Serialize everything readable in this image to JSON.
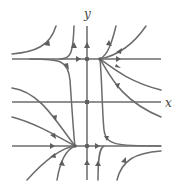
{
  "figure": {
    "type": "phase-portrait",
    "axes": {
      "x_label": "x",
      "y_label": "y"
    },
    "colors": {
      "curve": "#6b6b6b",
      "arrow": "#5e5e5e",
      "background": "#ffffff"
    },
    "equilibria": [
      {
        "position": "upper-left-on-y-axis",
        "px": [
          87,
          59
        ]
      },
      {
        "position": "upper-right",
        "px": [
          100,
          59
        ]
      },
      {
        "position": "lower-on-y-axis",
        "px": [
          87,
          146
        ]
      },
      {
        "position": "lower-left",
        "px": [
          75,
          146
        ]
      }
    ],
    "invariant_lines": [
      {
        "name": "upper-horizontal",
        "y_px": 59
      },
      {
        "name": "x-axis",
        "y_px": 102
      },
      {
        "name": "lower-horizontal",
        "y_px": 146
      },
      {
        "name": "y-axis",
        "x_px": 87
      }
    ]
  }
}
